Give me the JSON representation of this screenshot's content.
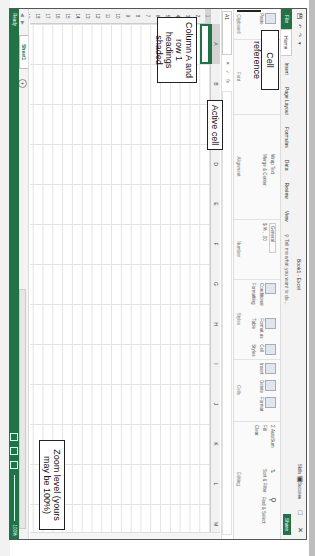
{
  "window": {
    "title": "Book1 - Excel",
    "user": "Skills for Success",
    "controls": [
      "ribbon-display-icon",
      "minimize-icon",
      "restore-icon",
      "close-icon"
    ]
  },
  "quick_access": [
    "save-icon",
    "undo-icon",
    "redo-icon",
    "customize-icon"
  ],
  "tabs": [
    {
      "label": "File"
    },
    {
      "label": "Home",
      "active": true
    },
    {
      "label": "Insert"
    },
    {
      "label": "Page Layout"
    },
    {
      "label": "Formulas"
    },
    {
      "label": "Data"
    },
    {
      "label": "Review"
    },
    {
      "label": "View"
    }
  ],
  "tell_me": "Tell me what you want to do...",
  "share_label": "Share",
  "ribbon": {
    "groups": [
      {
        "name": "Clipboard",
        "label": "Clipboard",
        "items": [
          "Paste"
        ]
      },
      {
        "name": "Font",
        "label": "Font",
        "items": [
          "11",
          "A˄",
          "A˅",
          "B",
          "I",
          "U",
          "A"
        ]
      },
      {
        "name": "Alignment",
        "label": "Alignment",
        "items": [
          "Wrap Text",
          "Merge & Center"
        ]
      },
      {
        "name": "Number",
        "label": "Number",
        "items": [
          "General",
          "$",
          "%",
          ",",
          ".00"
        ]
      },
      {
        "name": "Styles",
        "label": "Styles",
        "items": [
          "Conditional Formatting",
          "Format as Table",
          "Cell Styles"
        ]
      },
      {
        "name": "Cells",
        "label": "Cells",
        "items": [
          "Insert",
          "Delete",
          "Format"
        ]
      },
      {
        "name": "Editing",
        "label": "Editing",
        "items": [
          "AutoSum",
          "Fill",
          "Clear",
          "Sort & Filter",
          "Find & Select"
        ]
      }
    ]
  },
  "formula_bar": {
    "name_box": "A1",
    "buttons": [
      "✕",
      "✓",
      "fx"
    ],
    "value": ""
  },
  "grid": {
    "columns": [
      "A",
      "B",
      "C",
      "D",
      "E",
      "F",
      "G",
      "H",
      "I",
      "J",
      "K",
      "L",
      "M",
      "N",
      "O",
      "P"
    ],
    "rows": [
      "1",
      "2",
      "3",
      "4",
      "5",
      "6",
      "7",
      "8",
      "9",
      "10",
      "11",
      "12",
      "13",
      "14",
      "15",
      "16",
      "17",
      "18",
      "19"
    ],
    "active_cell": "A1",
    "selected_column": "A",
    "selected_row": "1"
  },
  "sheets": {
    "tabs": [
      "Sheet1"
    ],
    "add_label": "+"
  },
  "status": {
    "mode": "Ready",
    "zoom": "100%"
  },
  "callouts": {
    "cell_reference": "Cell reference",
    "active_cell": "Active cell",
    "headings_shaded": "Column A and row 1 headings shaded",
    "zoom_level": "Zoom level (yours may be 100%)"
  },
  "colors": {
    "accent": "#217346",
    "header_gray": "#f1f1f1",
    "selected_header": "#d4d4d4",
    "gridline": "#e3e3e3"
  }
}
